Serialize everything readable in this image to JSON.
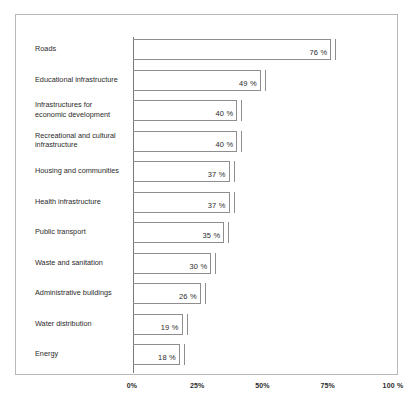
{
  "chart_data": {
    "type": "bar",
    "orientation": "horizontal",
    "title": "",
    "subtitle": "",
    "xlabel": "",
    "ylabel": "",
    "xlim": [
      0,
      100
    ],
    "grid": false,
    "legend": null,
    "categories": [
      "Roads",
      "Educational infrastructure",
      "Infrastructures for\neconomic development",
      "Recreational and cultural\ninfrastructure",
      "Housing and communities",
      "Health infrastructure",
      "Public transport",
      "Waste and sanitation",
      "Administrative buildings",
      "Water distribution",
      "Energy"
    ],
    "values": [
      76,
      49,
      40,
      40,
      37,
      37,
      35,
      30,
      26,
      19,
      18
    ],
    "value_labels": [
      "76 %",
      "49 %",
      "40 %",
      "40 %",
      "37 %",
      "37 %",
      "35 %",
      "30 %",
      "26 %",
      "19 %",
      "18 %"
    ],
    "x_ticks": [
      0,
      25,
      50,
      75,
      100
    ],
    "x_tick_labels": [
      "0%",
      "25%",
      "50%",
      "75%",
      "100 %"
    ],
    "colors": {
      "bar_outline": "#8e8e8e",
      "bar_fill": "transparent",
      "axis": "#7a7a7a",
      "frame": "#b9b9b9",
      "text": "#2b2b2b",
      "background": "#ffffff"
    }
  }
}
